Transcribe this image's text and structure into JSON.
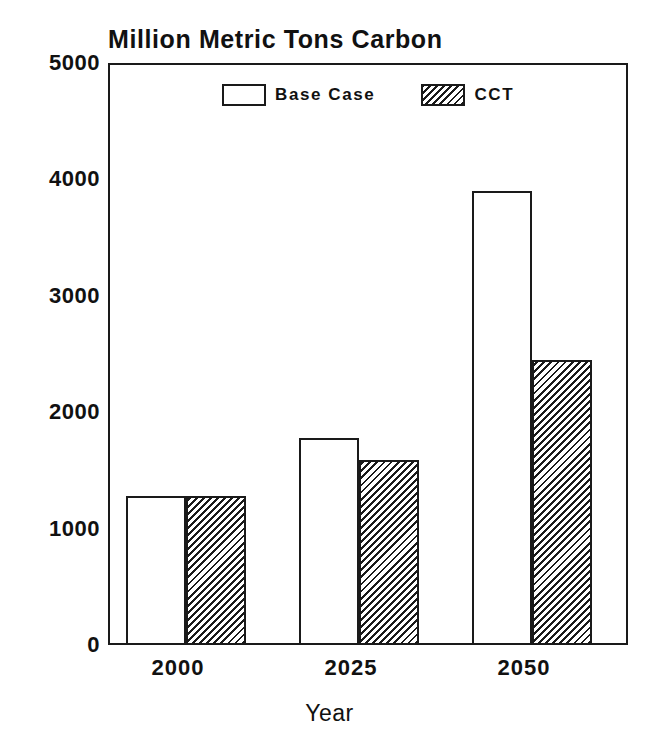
{
  "chart_data": {
    "type": "bar",
    "title": "Million Metric Tons Carbon",
    "xlabel": "Year",
    "ylabel": "",
    "categories": [
      "2000",
      "2025",
      "2050"
    ],
    "series": [
      {
        "name": "Base Case",
        "values": [
          1280,
          1780,
          3900
        ],
        "fill": "white",
        "edge": "#1a1a1a"
      },
      {
        "name": "CCT",
        "values": [
          1280,
          1590,
          2450
        ],
        "fill": "diagonal-hatch",
        "edge": "#1a1a1a"
      }
    ],
    "ylim": [
      0,
      5000
    ],
    "yticks": [
      0,
      1000,
      2000,
      3000,
      4000,
      5000
    ],
    "ytick_labels": [
      "0",
      "1000",
      "2000",
      "3000",
      "4000",
      "5000"
    ],
    "xtick_labels": [
      "2000",
      "2025",
      "2050"
    ],
    "grid": false,
    "legend_position": "upper center",
    "legend_entries": [
      "Base Case",
      "CCT"
    ],
    "annotations": []
  },
  "legend": {
    "base_label": "Base Case",
    "cct_label": "CCT"
  },
  "axis": {
    "x_title": "Year"
  }
}
